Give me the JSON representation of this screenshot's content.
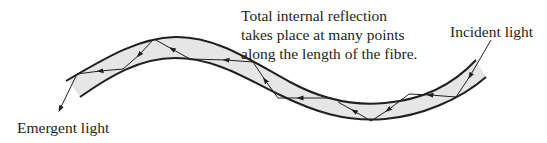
{
  "diagram": {
    "labels": {
      "caption_line1": "Total internal reflection",
      "caption_line2": "takes place at many points",
      "caption_line3": "along the length of the fibre.",
      "incident": "Incident light",
      "emergent": "Emergent light"
    },
    "colors": {
      "stroke": "#231f20",
      "core_fill": "#e6e6e6",
      "background": "#ffffff"
    }
  }
}
